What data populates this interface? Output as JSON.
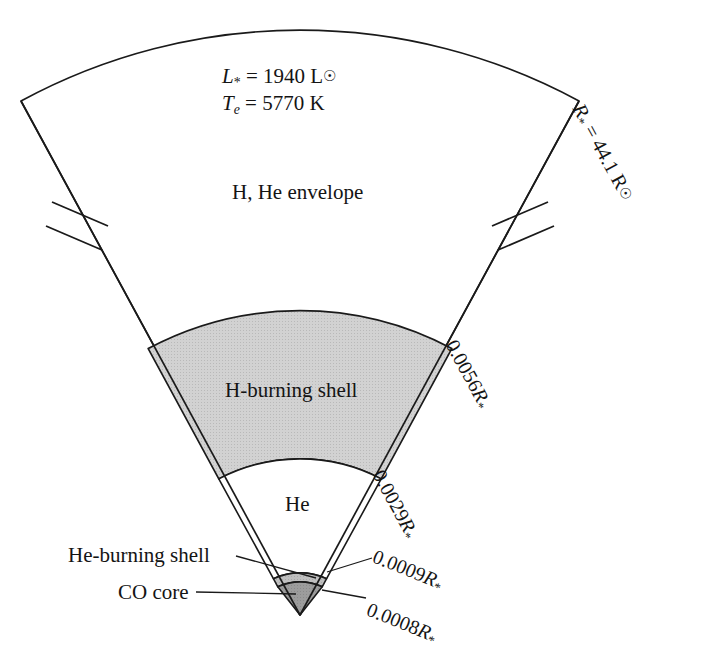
{
  "figure": {
    "type": "stellar-structure-wedge-diagram",
    "background_color": "#ffffff",
    "line_color": "#1a1a1a",
    "geometry": {
      "center_x": 300,
      "center_y": 615,
      "outer_radius": 585,
      "half_angle_deg": 28.5,
      "apex_note": "wedge apex at stellar center (bottom), outer arc = stellar surface (top)",
      "scale_break_radius": 405
    },
    "stats": {
      "luminosity": {
        "symbol": "L",
        "symbol_sub": "*",
        "equals": "=",
        "value": "1940",
        "unit": "L",
        "unit_sub": "⊙"
      },
      "effective_temperature": {
        "symbol": "T",
        "symbol_sub": "e",
        "equals": "=",
        "value": "5770",
        "unit": "K"
      }
    },
    "radius_label": {
      "symbol": "R",
      "symbol_sub": "*",
      "equals": "=",
      "value": "44.1",
      "unit": "R",
      "unit_sub": "⊙",
      "full_text": "R* = 44.1 R⊙"
    },
    "zones": [
      {
        "id": "envelope",
        "label": "H, He envelope",
        "fill": "#ffffff",
        "outer_fraction": 1.0,
        "inner_fraction": 0.0056
      },
      {
        "id": "h-burning-shell",
        "label": "H-burning shell",
        "fill": "#cccccc",
        "outer_fraction": 0.0056,
        "inner_fraction": 0.0029
      },
      {
        "id": "he-layer",
        "label": "He",
        "fill": "#ffffff",
        "outer_fraction": 0.0029,
        "inner_fraction": 0.0009
      },
      {
        "id": "he-burning-shell",
        "label": "He-burning shell",
        "fill": "#bdbdbd",
        "outer_fraction": 0.0009,
        "inner_fraction": 0.0008
      },
      {
        "id": "co-core",
        "label": "CO core",
        "fill": "#9a9a9a",
        "outer_fraction": 0.0008,
        "inner_fraction": 0.0
      }
    ],
    "boundary_labels": [
      {
        "id": "r-star",
        "text": "R* = 44.1 R⊙",
        "value": "44.1",
        "unit": "R⊙",
        "position": "outer-right-rotated"
      },
      {
        "id": "r-0056",
        "text": "0.0056R*",
        "value": "0.0056",
        "unit": "R*",
        "position": "right-rotated"
      },
      {
        "id": "r-0029",
        "text": "0.0029R*",
        "value": "0.0029",
        "unit": "R*",
        "position": "right-rotated"
      },
      {
        "id": "r-0009",
        "text": "0.0009R*",
        "value": "0.0009",
        "unit": "R*",
        "position": "right-leader"
      },
      {
        "id": "r-0008",
        "text": "0.0008R*",
        "value": "0.0008",
        "unit": "R*",
        "position": "right-leader"
      }
    ],
    "callouts": [
      {
        "id": "he-burning-shell-callout",
        "text": "He-burning shell",
        "side": "left"
      },
      {
        "id": "co-core-callout",
        "text": "CO core",
        "side": "left"
      }
    ],
    "scale_break": {
      "present": true,
      "count": 2,
      "description": "double tick break marks on both radial edges indicating a broken radial scale"
    },
    "colors": {
      "h_shell_gray": "#cccccc",
      "he_shell_gray": "#bdbdbd",
      "co_core_gray": "#9a9a9a",
      "stroke": "#1a1a1a"
    }
  }
}
